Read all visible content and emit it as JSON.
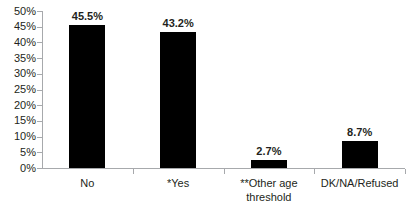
{
  "chart_data": {
    "type": "bar",
    "title": "",
    "subtitle": "",
    "xlabel": "",
    "ylabel": "",
    "categories": [
      "No",
      "*Yes",
      "**Other age threshold",
      "DK/NA/Refused"
    ],
    "category_lines": [
      [
        "No"
      ],
      [
        "*Yes"
      ],
      [
        "**Other age",
        "threshold"
      ],
      [
        "DK/NA/Refused"
      ]
    ],
    "values": [
      45.5,
      43.2,
      2.7,
      8.7
    ],
    "value_labels": [
      "45.5%",
      "43.2%",
      "2.7%",
      "8.7%"
    ],
    "ylim": [
      0,
      50
    ],
    "ytick_values": [
      0,
      5,
      10,
      15,
      20,
      25,
      30,
      35,
      40,
      45,
      50
    ],
    "ytick_labels": [
      "0%",
      "5%",
      "10%",
      "15%",
      "20%",
      "25%",
      "30%",
      "35%",
      "40%",
      "45%",
      "50%"
    ],
    "grid": false,
    "legend": "none",
    "bar_color": "#000000",
    "axis_color": "#a7a9ac",
    "text_color": "#231f20",
    "background_color": "#ffffff"
  }
}
